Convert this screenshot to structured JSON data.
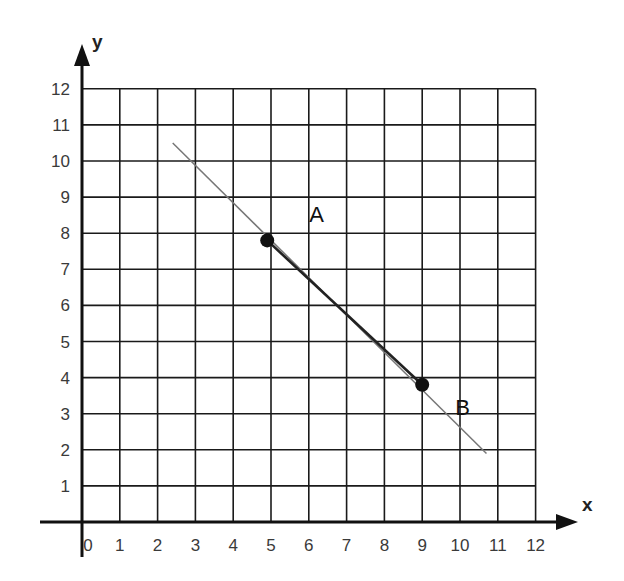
{
  "chart_data": {
    "type": "line",
    "title": "",
    "xlabel": "x",
    "ylabel": "y",
    "xlim": [
      0,
      12
    ],
    "ylim": [
      0,
      12
    ],
    "grid": true,
    "x_ticks": [
      "0",
      "1",
      "2",
      "3",
      "4",
      "5",
      "6",
      "7",
      "8",
      "9",
      "10",
      "11",
      "12"
    ],
    "y_ticks": [
      "1",
      "2",
      "3",
      "4",
      "5",
      "6",
      "7",
      "8",
      "9",
      "10",
      "11",
      "12"
    ],
    "series": [
      {
        "name": "line through A and B",
        "x": [
          2.4,
          10.7
        ],
        "y": [
          10.5,
          1.9
        ]
      }
    ],
    "points": [
      {
        "label": "A",
        "x": 4.9,
        "y": 7.8
      },
      {
        "label": "B",
        "x": 9,
        "y": 3.8
      }
    ],
    "segment": {
      "from": "A",
      "to": "B"
    }
  },
  "labels": {
    "x_axis": "x",
    "y_axis": "y",
    "point_a": "A",
    "point_b": "B"
  }
}
